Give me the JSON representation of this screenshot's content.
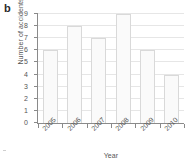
{
  "panel": {
    "letter": "b"
  },
  "chart_data": {
    "type": "bar",
    "title": "",
    "subtitle": "",
    "xlabel": "Year",
    "ylabel": "Number of accidents",
    "categories": [
      "2005",
      "2006",
      "2007",
      "2008",
      "2009",
      "2010"
    ],
    "values": [
      6,
      8,
      7,
      9,
      6,
      4
    ],
    "series": [
      {
        "name": "Number of accidents",
        "values": [
          6,
          8,
          7,
          9,
          6,
          4
        ]
      }
    ],
    "ylim": [
      0,
      9
    ],
    "ytick_labels": [
      "0",
      "1",
      "2",
      "3",
      "4",
      "5",
      "6",
      "7",
      "8",
      "9"
    ],
    "ytick_values": [
      0,
      1,
      2,
      3,
      4,
      5,
      6,
      7,
      8,
      9
    ],
    "xtick_labels": [
      "2005",
      "2006",
      "2007",
      "2008",
      "2009",
      "2010"
    ],
    "grid": "horizontal",
    "legend": "none",
    "legend_position": "",
    "annotations": [],
    "colors": {
      "bar_fill": "#fafafa",
      "bar_stroke": "#d9d9d9",
      "grid": "#e6e6e6",
      "axis": "#8a8a8a",
      "text": "#555555",
      "panel_letter": "#2b2b2b"
    }
  }
}
